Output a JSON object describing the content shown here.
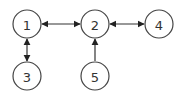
{
  "diagram": {
    "type": "directed-graph",
    "nodes": [
      {
        "id": "1",
        "label": "1",
        "cx": 27,
        "cy": 24
      },
      {
        "id": "2",
        "label": "2",
        "cx": 95,
        "cy": 24
      },
      {
        "id": "4",
        "label": "4",
        "cx": 159,
        "cy": 24
      },
      {
        "id": "3",
        "label": "3",
        "cx": 27,
        "cy": 76
      },
      {
        "id": "5",
        "label": "5",
        "cx": 95,
        "cy": 76
      }
    ],
    "edges": [
      {
        "from": "1",
        "to": "2",
        "direction": "bidirectional"
      },
      {
        "from": "2",
        "to": "4",
        "direction": "bidirectional"
      },
      {
        "from": "1",
        "to": "3",
        "direction": "bidirectional"
      },
      {
        "from": "5",
        "to": "2",
        "direction": "forward"
      }
    ],
    "colors": {
      "stroke": "#444444",
      "text": "#333333",
      "background": "#ffffff"
    }
  }
}
